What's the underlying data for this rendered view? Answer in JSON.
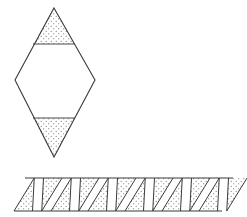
{
  "figure": {
    "background_color": "#ffffff",
    "stroke_color": "#3a3a3a",
    "stipple_color": "#555555",
    "stipple_label": "dotted-shading",
    "canvas": {
      "width": 247,
      "height": 217
    }
  },
  "shapes": [
    {
      "id": "diamond-net",
      "name": "bipyramid-net-diamond",
      "type": "polygon-net",
      "description": "Vertical diamond net divided by two horizontal fold lines into a shaded top triangle, an unshaded middle band, and a shaded bottom triangle",
      "outline_points": "54,8 95,80 54,157 15,80",
      "vertices": {
        "top_apex": [
          54,
          8
        ],
        "right": [
          95,
          80
        ],
        "bottom_apex": [
          54,
          157
        ],
        "left": [
          15,
          80
        ]
      },
      "fold_lines": [
        {
          "name": "upper-fold",
          "points": "33,44 75,44",
          "y": 44
        },
        {
          "name": "lower-fold",
          "points": "33,118 75,118",
          "y": 118
        }
      ],
      "faces": [
        {
          "name": "top-triangle-face",
          "points": "54,8 75,44 33,44",
          "shaded": true
        },
        {
          "name": "middle-band-face",
          "points": "33,44 75,44 95,80 75,118 33,118 15,80",
          "shaded": false
        },
        {
          "name": "bottom-triangle-face",
          "points": "33,118 75,118 54,157",
          "shaded": true
        }
      ]
    },
    {
      "id": "strip-net",
      "name": "antiprism-net-triangle-strip",
      "type": "polygon-net",
      "description": "Horizontal strip of alternating up and down pointing triangles forming a parallelogram band",
      "band": {
        "top_y": 178,
        "bottom_y": 211,
        "top_left_x": 25,
        "top_right_x": 233,
        "bottom_left_x": 14,
        "bottom_right_x": 222,
        "triangle_count": 12,
        "triangle_width": 37
      },
      "shaded_faces": [
        {
          "name": "down-triangle-1",
          "points": "81,178 118,178 99,211",
          "shaded": true
        },
        {
          "name": "down-triangle-2",
          "points": "118,178 155,178 136,211",
          "shaded": false
        },
        {
          "name": "up-triangle-1",
          "points": "25,211 62,211 44,178",
          "shaded": true
        }
      ]
    }
  ],
  "legend": {
    "shaded_meaning": "dotted-shaded faces",
    "unshaded_meaning": "plain faces"
  }
}
